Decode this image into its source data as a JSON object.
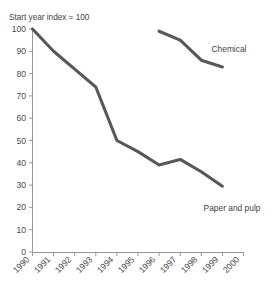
{
  "chart_data": {
    "type": "line",
    "title": "Start year index = 100",
    "xlabel": "",
    "ylabel": "",
    "xlim": [
      1990,
      2000
    ],
    "ylim": [
      0,
      100
    ],
    "grid": false,
    "legend_position": "inline-right",
    "x_ticks": [
      "1990",
      "1991",
      "1992",
      "1993",
      "1994",
      "1995",
      "1996",
      "1997",
      "1998",
      "1999",
      "2000"
    ],
    "y_ticks": [
      "0",
      "10",
      "20",
      "30",
      "40",
      "50",
      "60",
      "70",
      "80",
      "90",
      "100"
    ],
    "x": [
      1990,
      1991,
      1992,
      1993,
      1994,
      1995,
      1996,
      1997,
      1998,
      1999,
      2000
    ],
    "series": [
      {
        "name": "Paper and pulp",
        "color": "#585858",
        "x": [
          1990,
          1991,
          1992,
          1993,
          1994,
          1995,
          1996,
          1997,
          1998,
          1999
        ],
        "values": [
          100,
          90,
          82,
          74,
          50,
          45,
          39,
          41.5,
          36,
          29.5
        ]
      },
      {
        "name": "Chemical",
        "color": "#585858",
        "x": [
          1996,
          1997,
          1998,
          1999
        ],
        "values": [
          99,
          95,
          86,
          83
        ]
      }
    ],
    "annotations": [
      {
        "name": "Chemical",
        "text": "Chemical",
        "x": 2000.0,
        "y": 87
      },
      {
        "name": "Paper and pulp",
        "text": "Paper and pulp",
        "x": 1998.2,
        "y": 20
      }
    ]
  },
  "labels": {
    "title": "Start year index = 100",
    "chemical": "Chemical",
    "paper_and_pulp": "Paper and pulp",
    "y_0": "0",
    "y_10": "10",
    "y_20": "20",
    "y_30": "30",
    "y_40": "40",
    "y_50": "50",
    "y_60": "60",
    "y_70": "70",
    "y_80": "80",
    "y_90": "90",
    "y_100": "100",
    "x_1990": "1990",
    "x_1991": "1991",
    "x_1992": "1992",
    "x_1993": "1993",
    "x_1994": "1994",
    "x_1995": "1995",
    "x_1996": "1996",
    "x_1997": "1997",
    "x_1998": "1998",
    "x_1999": "1999",
    "x_2000": "2000"
  },
  "colors": {
    "line": "#585858",
    "axis": "#8a8a8a",
    "text": "#4a4a4a",
    "background": "#ffffff"
  }
}
